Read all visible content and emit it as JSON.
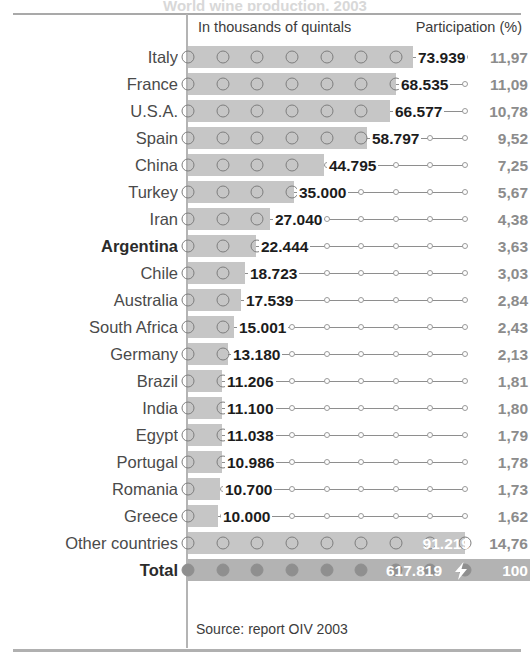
{
  "title_ghost": "World wine production, 2003",
  "header": {
    "units_label": "In thousands of quintals",
    "participation_label": "Participation (%)"
  },
  "footer": {
    "source": "Source: report OIV 2003"
  },
  "colors": {
    "bar_fill": "#c6c6c6",
    "total_bar_fill": "#b3b3b3",
    "marker_stroke": "#7e7e7e",
    "label_text": "#4a4a4a",
    "value_text": "#1c1c1c",
    "pct_text": "#8c8c8c",
    "rule": "#a9a9a9"
  },
  "chart_data": {
    "type": "bar",
    "title": "World wine production, 2003",
    "xlabel": "In thousands of quintals",
    "ylabel": "",
    "orientation": "horizontal",
    "grid": false,
    "legend": false,
    "xlim": [
      0,
      617819
    ],
    "value_format": "thousands separator '.'",
    "percent_format": "decimal comma",
    "source": "Source: report OIV 2003",
    "columns": [
      "Country",
      "In thousands of quintals",
      "Participation (%)"
    ],
    "categories": [
      "Italy",
      "France",
      "U.S.A.",
      "Spain",
      "China",
      "Turkey",
      "Iran",
      "Argentina",
      "Chile",
      "Australia",
      "South Africa",
      "Germany",
      "Brazil",
      "India",
      "Egypt",
      "Portugal",
      "Romania",
      "Greece",
      "Other countries",
      "Total"
    ],
    "values": [
      73939,
      68535,
      66577,
      58797,
      44795,
      35000,
      27040,
      22444,
      18723,
      17539,
      15001,
      13180,
      11206,
      11100,
      11038,
      10986,
      10700,
      10000,
      91219,
      617819
    ],
    "percents": [
      11.97,
      11.09,
      10.78,
      9.52,
      7.25,
      5.67,
      4.38,
      3.63,
      3.03,
      2.84,
      2.43,
      2.13,
      1.81,
      1.8,
      1.79,
      1.78,
      1.73,
      1.62,
      14.76,
      100
    ],
    "rows": [
      {
        "label": "Italy",
        "value": "73.939",
        "pct": "11,97",
        "frac": 0.811,
        "bold": false,
        "on_bar": false,
        "total": false
      },
      {
        "label": "France",
        "value": "68.535",
        "pct": "11,09",
        "frac": 0.752,
        "bold": false,
        "on_bar": false,
        "total": false
      },
      {
        "label": "U.S.A.",
        "value": "66.577",
        "pct": "10,78",
        "frac": 0.73,
        "bold": false,
        "on_bar": false,
        "total": false
      },
      {
        "label": "Spain",
        "value": "58.797",
        "pct": "9,52",
        "frac": 0.645,
        "bold": false,
        "on_bar": false,
        "total": false
      },
      {
        "label": "China",
        "value": "44.795",
        "pct": "7,25",
        "frac": 0.491,
        "bold": false,
        "on_bar": false,
        "total": false
      },
      {
        "label": "Turkey",
        "value": "35.000",
        "pct": "5,67",
        "frac": 0.384,
        "bold": false,
        "on_bar": false,
        "total": false
      },
      {
        "label": "Iran",
        "value": "27.040",
        "pct": "4,38",
        "frac": 0.297,
        "bold": false,
        "on_bar": false,
        "total": false
      },
      {
        "label": "Argentina",
        "value": "22.444",
        "pct": "3,63",
        "frac": 0.246,
        "bold": true,
        "on_bar": false,
        "total": false
      },
      {
        "label": "Chile",
        "value": "18.723",
        "pct": "3,03",
        "frac": 0.205,
        "bold": false,
        "on_bar": false,
        "total": false
      },
      {
        "label": "Australia",
        "value": "17.539",
        "pct": "2,84",
        "frac": 0.192,
        "bold": false,
        "on_bar": false,
        "total": false
      },
      {
        "label": "South Africa",
        "value": "15.001",
        "pct": "2,43",
        "frac": 0.165,
        "bold": false,
        "on_bar": false,
        "total": false
      },
      {
        "label": "Germany",
        "value": "13.180",
        "pct": "2,13",
        "frac": 0.145,
        "bold": false,
        "on_bar": false,
        "total": false
      },
      {
        "label": "Brazil",
        "value": "11.206",
        "pct": "1,81",
        "frac": 0.123,
        "bold": false,
        "on_bar": false,
        "total": false
      },
      {
        "label": "India",
        "value": "11.100",
        "pct": "1,80",
        "frac": 0.122,
        "bold": false,
        "on_bar": false,
        "total": false
      },
      {
        "label": "Egypt",
        "value": "11.038",
        "pct": "1,79",
        "frac": 0.121,
        "bold": false,
        "on_bar": false,
        "total": false
      },
      {
        "label": "Portugal",
        "value": "10.986",
        "pct": "1,78",
        "frac": 0.121,
        "bold": false,
        "on_bar": false,
        "total": false
      },
      {
        "label": "Romania",
        "value": "10.700",
        "pct": "1,73",
        "frac": 0.117,
        "bold": false,
        "on_bar": false,
        "total": false
      },
      {
        "label": "Greece",
        "value": "10.000",
        "pct": "1,62",
        "frac": 0.11,
        "bold": false,
        "on_bar": false,
        "total": false
      },
      {
        "label": "Other countries",
        "value": "91.219",
        "pct": "14,76",
        "frac": 1.0,
        "bold": false,
        "on_bar": true,
        "total": false
      },
      {
        "label": "Total",
        "value": "617.819",
        "pct": "100",
        "frac": 1.0,
        "bold": true,
        "on_bar": true,
        "total": true
      }
    ]
  }
}
